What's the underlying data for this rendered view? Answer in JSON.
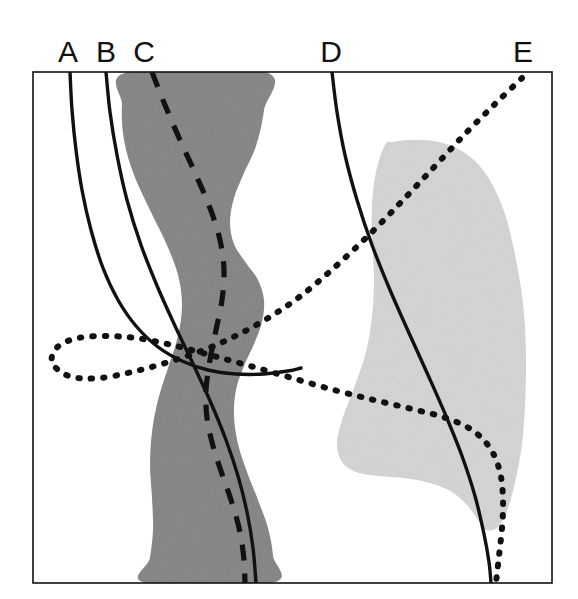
{
  "figure": {
    "domain": "chart",
    "background_color": "#ffffff",
    "frame": {
      "name": "plot-frame",
      "x": 33,
      "y": 72,
      "width": 519,
      "height": 511,
      "stroke_color": "#111111",
      "stroke_width": 1.6
    },
    "canvas": {
      "width": 578,
      "height": 599
    }
  },
  "chart_data": {
    "type": "line",
    "title": "",
    "subtitle": "",
    "xlabel": "",
    "ylabel": "",
    "xlim": [
      33,
      552
    ],
    "ylim": [
      72,
      583
    ],
    "grid": false,
    "legend_position": "top-outside",
    "axis_ticks": {
      "x": [],
      "y": []
    },
    "orientation": "vertical-profiles",
    "labels": [
      {
        "id": "A",
        "text": "A",
        "x": 68,
        "y": 62
      },
      {
        "id": "B",
        "text": "B",
        "x": 106,
        "y": 62
      },
      {
        "id": "C",
        "text": "C",
        "x": 144,
        "y": 62
      },
      {
        "id": "D",
        "text": "D",
        "x": 331,
        "y": 62
      },
      {
        "id": "E",
        "text": "E",
        "x": 523,
        "y": 62
      }
    ],
    "series": [
      {
        "name": "A",
        "style": "solid",
        "color": "#111111",
        "stroke_width": 3.4,
        "points": [
          [
            70,
            72
          ],
          [
            72,
            110
          ],
          [
            76,
            150
          ],
          [
            82,
            190
          ],
          [
            91,
            230
          ],
          [
            103,
            268
          ],
          [
            118,
            300
          ],
          [
            136,
            326
          ],
          [
            158,
            347
          ],
          [
            182,
            361
          ],
          [
            208,
            370
          ],
          [
            236,
            374
          ],
          [
            264,
            374
          ],
          [
            288,
            371
          ],
          [
            301,
            368
          ]
        ]
      },
      {
        "name": "B",
        "style": "solid",
        "color": "#111111",
        "stroke_width": 3.4,
        "points": [
          [
            106,
            72
          ],
          [
            110,
            112
          ],
          [
            117,
            155
          ],
          [
            127,
            200
          ],
          [
            141,
            245
          ],
          [
            158,
            288
          ],
          [
            176,
            328
          ],
          [
            194,
            366
          ],
          [
            211,
            403
          ],
          [
            226,
            440
          ],
          [
            238,
            476
          ],
          [
            247,
            512
          ],
          [
            253,
            548
          ],
          [
            256,
            583
          ]
        ]
      },
      {
        "name": "C",
        "style": "dashed",
        "color": "#111111",
        "stroke_width": 5.2,
        "dash_pattern": "16 13",
        "points": [
          [
            152,
            72
          ],
          [
            165,
            105
          ],
          [
            180,
            140
          ],
          [
            196,
            175
          ],
          [
            210,
            208
          ],
          [
            220,
            240
          ],
          [
            224,
            270
          ],
          [
            222,
            300
          ],
          [
            216,
            330
          ],
          [
            210,
            360
          ],
          [
            206,
            390
          ],
          [
            207,
            418
          ],
          [
            213,
            446
          ],
          [
            222,
            474
          ],
          [
            232,
            503
          ],
          [
            240,
            532
          ],
          [
            244,
            560
          ],
          [
            245,
            583
          ]
        ]
      },
      {
        "name": "D",
        "style": "solid",
        "color": "#111111",
        "stroke_width": 3.4,
        "points": [
          [
            332,
            72
          ],
          [
            337,
            112
          ],
          [
            345,
            155
          ],
          [
            357,
            200
          ],
          [
            372,
            245
          ],
          [
            390,
            290
          ],
          [
            409,
            333
          ],
          [
            428,
            375
          ],
          [
            446,
            416
          ],
          [
            462,
            456
          ],
          [
            475,
            496
          ],
          [
            484,
            534
          ],
          [
            489,
            562
          ],
          [
            491,
            583
          ]
        ]
      },
      {
        "name": "E",
        "style": "dotted",
        "color": "#111111",
        "stroke_width": 6.0,
        "dash_pattern": "1.5 11",
        "points": [
          [
            522,
            78
          ],
          [
            495,
            104
          ],
          [
            466,
            133
          ],
          [
            436,
            165
          ],
          [
            405,
            198
          ],
          [
            372,
            232
          ],
          [
            336,
            266
          ],
          [
            298,
            298
          ],
          [
            258,
            324
          ],
          [
            216,
            345
          ],
          [
            175,
            360
          ],
          [
            136,
            371
          ],
          [
            100,
            378
          ],
          [
            72,
            377
          ],
          [
            55,
            367
          ],
          [
            52,
            356
          ],
          [
            60,
            345
          ],
          [
            78,
            338
          ],
          [
            104,
            336
          ],
          [
            136,
            338
          ],
          [
            172,
            345
          ],
          [
            210,
            355
          ],
          [
            250,
            366
          ],
          [
            292,
            378
          ],
          [
            334,
            390
          ],
          [
            374,
            400
          ],
          [
            412,
            409
          ],
          [
            446,
            418
          ],
          [
            472,
            430
          ],
          [
            490,
            448
          ],
          [
            500,
            472
          ],
          [
            503,
            500
          ],
          [
            502,
            528
          ],
          [
            499,
            556
          ],
          [
            496,
            583
          ]
        ]
      }
    ],
    "bands": [
      {
        "name": "dark-band",
        "fill": "#8a8a8a",
        "texture": "speckled",
        "outline": [
          [
            128,
            72
          ],
          [
            122,
            105
          ],
          [
            124,
            140
          ],
          [
            134,
            175
          ],
          [
            150,
            210
          ],
          [
            166,
            243
          ],
          [
            178,
            275
          ],
          [
            182,
            305
          ],
          [
            178,
            336
          ],
          [
            168,
            368
          ],
          [
            158,
            400
          ],
          [
            152,
            432
          ],
          [
            150,
            465
          ],
          [
            152,
            498
          ],
          [
            153,
            530
          ],
          [
            150,
            558
          ],
          [
            146,
            583
          ],
          [
            272,
            583
          ],
          [
            273,
            556
          ],
          [
            268,
            528
          ],
          [
            258,
            500
          ],
          [
            247,
            472
          ],
          [
            238,
            444
          ],
          [
            234,
            416
          ],
          [
            236,
            390
          ],
          [
            244,
            366
          ],
          [
            254,
            344
          ],
          [
            262,
            322
          ],
          [
            264,
            300
          ],
          [
            258,
            280
          ],
          [
            246,
            263
          ],
          [
            234,
            244
          ],
          [
            230,
            222
          ],
          [
            234,
            198
          ],
          [
            244,
            173
          ],
          [
            256,
            146
          ],
          [
            264,
            110
          ],
          [
            265,
            72
          ]
        ]
      },
      {
        "name": "light-band",
        "fill": "#d6d6d6",
        "texture": "speckled",
        "outline": [
          [
            385,
            145
          ],
          [
            376,
            172
          ],
          [
            372,
            205
          ],
          [
            372,
            240
          ],
          [
            374,
            278
          ],
          [
            372,
            316
          ],
          [
            366,
            352
          ],
          [
            354,
            388
          ],
          [
            342,
            420
          ],
          [
            337,
            444
          ],
          [
            342,
            462
          ],
          [
            356,
            472
          ],
          [
            378,
            476
          ],
          [
            404,
            478
          ],
          [
            430,
            483
          ],
          [
            452,
            492
          ],
          [
            468,
            506
          ],
          [
            478,
            520
          ],
          [
            486,
            530
          ],
          [
            498,
            527
          ],
          [
            508,
            508
          ],
          [
            516,
            478
          ],
          [
            522,
            444
          ],
          [
            525,
            406
          ],
          [
            526,
            366
          ],
          [
            525,
            326
          ],
          [
            521,
            288
          ],
          [
            514,
            250
          ],
          [
            505,
            214
          ],
          [
            492,
            184
          ],
          [
            476,
            162
          ],
          [
            456,
            148
          ],
          [
            434,
            141
          ],
          [
            410,
            140
          ],
          [
            393,
            142
          ]
        ]
      }
    ]
  }
}
